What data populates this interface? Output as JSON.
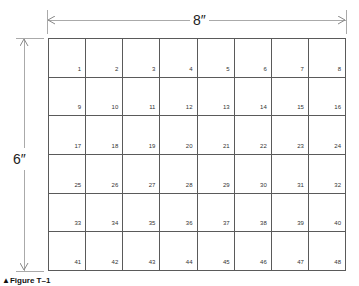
{
  "figure": {
    "caption": "▲Figure T–1",
    "width_label": "8″",
    "height_label": "6″",
    "columns": 8,
    "rows": 6,
    "cells": [
      "1",
      "2",
      "3",
      "4",
      "5",
      "6",
      "7",
      "8",
      "9",
      "10",
      "11",
      "12",
      "13",
      "14",
      "15",
      "16",
      "17",
      "18",
      "19",
      "20",
      "21",
      "22",
      "23",
      "24",
      "25",
      "26",
      "27",
      "28",
      "29",
      "30",
      "31",
      "32",
      "33",
      "34",
      "35",
      "36",
      "37",
      "38",
      "39",
      "40",
      "41",
      "42",
      "43",
      "44",
      "45",
      "46",
      "47",
      "48"
    ]
  }
}
